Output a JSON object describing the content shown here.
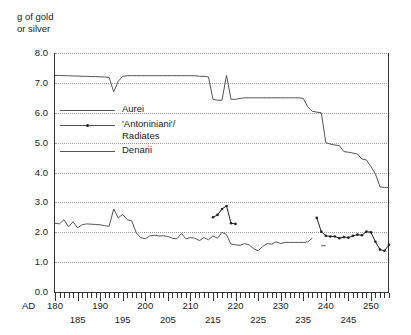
{
  "chart_data": {
    "type": "line",
    "title": "",
    "ylabel": "g of gold\nor silver",
    "xlabel": "AD",
    "ylim": [
      0.0,
      8.0
    ],
    "xlim": [
      180,
      254
    ],
    "grid": true,
    "legend_position": "inside-upper-left",
    "ytick_labels": [
      "8.0",
      "7.0",
      "6.0",
      "5.0",
      "4.0",
      "3.0",
      "2.0",
      "1.0",
      "0.0"
    ],
    "ytick_values": [
      8.0,
      7.0,
      6.0,
      5.0,
      4.0,
      3.0,
      2.0,
      1.0,
      0.0
    ],
    "xtick_labels_upper": [
      "180",
      "190",
      "200",
      "210",
      "220",
      "230",
      "240",
      "250"
    ],
    "xtick_labels_lower": [
      "185",
      "195",
      "205",
      "215",
      "225",
      "235",
      "245"
    ],
    "xtick_step": 1,
    "series": [
      {
        "name": "Aurei",
        "marker": "none",
        "color": "#555555",
        "points": [
          [
            180,
            7.25
          ],
          [
            181,
            7.25
          ],
          [
            182,
            7.24
          ],
          [
            183,
            7.24
          ],
          [
            184,
            7.23
          ],
          [
            185,
            7.23
          ],
          [
            186,
            7.22
          ],
          [
            187,
            7.22
          ],
          [
            188,
            7.21
          ],
          [
            189,
            7.21
          ],
          [
            190,
            7.2
          ],
          [
            191,
            7.2
          ],
          [
            192,
            7.18
          ],
          [
            193,
            6.7
          ],
          [
            194,
            7.05
          ],
          [
            195,
            7.22
          ],
          [
            196,
            7.24
          ],
          [
            197,
            7.24
          ],
          [
            198,
            7.24
          ],
          [
            199,
            7.24
          ],
          [
            200,
            7.24
          ],
          [
            201,
            7.24
          ],
          [
            202,
            7.24
          ],
          [
            203,
            7.24
          ],
          [
            204,
            7.24
          ],
          [
            205,
            7.24
          ],
          [
            206,
            7.24
          ],
          [
            207,
            7.24
          ],
          [
            208,
            7.24
          ],
          [
            209,
            7.24
          ],
          [
            210,
            7.24
          ],
          [
            211,
            7.24
          ],
          [
            212,
            7.22
          ],
          [
            213,
            7.22
          ],
          [
            214,
            7.2
          ],
          [
            215,
            6.45
          ],
          [
            216,
            6.42
          ],
          [
            217,
            6.42
          ],
          [
            218,
            7.25
          ],
          [
            219,
            6.45
          ],
          [
            220,
            6.45
          ],
          [
            221,
            6.48
          ],
          [
            222,
            6.5
          ],
          [
            223,
            6.5
          ],
          [
            224,
            6.5
          ],
          [
            225,
            6.5
          ],
          [
            226,
            6.5
          ],
          [
            227,
            6.5
          ],
          [
            228,
            6.5
          ],
          [
            229,
            6.5
          ],
          [
            230,
            6.5
          ],
          [
            231,
            6.5
          ],
          [
            232,
            6.5
          ],
          [
            233,
            6.5
          ],
          [
            234,
            6.5
          ],
          [
            235,
            6.48
          ],
          [
            236,
            6.2
          ],
          [
            237,
            6.05
          ],
          [
            238,
            6.02
          ],
          [
            239,
            6.0
          ],
          [
            240,
            5.0
          ],
          [
            241,
            4.95
          ],
          [
            242,
            4.92
          ],
          [
            243,
            4.9
          ],
          [
            244,
            4.7
          ],
          [
            245,
            4.68
          ],
          [
            246,
            4.65
          ],
          [
            247,
            4.62
          ],
          [
            248,
            4.45
          ],
          [
            249,
            4.42
          ],
          [
            250,
            4.2
          ],
          [
            251,
            3.95
          ],
          [
            252,
            3.52
          ],
          [
            253,
            3.5
          ],
          [
            254,
            3.5
          ]
        ]
      },
      {
        "name": "'Antoniniani'/\nRadiates",
        "marker": "dot",
        "color": "#222222",
        "segments": [
          [
            [
              215,
              2.5
            ],
            [
              216,
              2.58
            ],
            [
              217,
              2.78
            ],
            [
              218,
              2.88
            ],
            [
              219,
              2.3
            ],
            [
              220,
              2.28
            ]
          ],
          [
            [
              238,
              2.48
            ],
            [
              239,
              2.02
            ],
            [
              240,
              1.88
            ],
            [
              241,
              1.86
            ],
            [
              242,
              1.86
            ],
            [
              243,
              1.8
            ],
            [
              244,
              1.84
            ],
            [
              245,
              1.82
            ],
            [
              246,
              1.88
            ],
            [
              247,
              1.92
            ],
            [
              248,
              1.9
            ],
            [
              249,
              2.02
            ],
            [
              250,
              2.0
            ],
            [
              251,
              1.68
            ],
            [
              252,
              1.42
            ],
            [
              253,
              1.38
            ],
            [
              254,
              1.58
            ]
          ]
        ]
      },
      {
        "name": "Denarii",
        "marker": "none",
        "color": "#555555",
        "segments": [
          [
            [
              180,
              2.3
            ],
            [
              181,
              2.28
            ],
            [
              182,
              2.42
            ],
            [
              183,
              2.18
            ],
            [
              184,
              2.35
            ],
            [
              185,
              2.15
            ],
            [
              186,
              2.25
            ],
            [
              187,
              2.28
            ],
            [
              188,
              2.27
            ],
            [
              189,
              2.26
            ],
            [
              190,
              2.25
            ],
            [
              191,
              2.22
            ],
            [
              192,
              2.2
            ],
            [
              193,
              2.78
            ],
            [
              194,
              2.48
            ],
            [
              195,
              2.6
            ],
            [
              196,
              2.42
            ],
            [
              197,
              2.38
            ],
            [
              198,
              1.98
            ],
            [
              199,
              1.82
            ],
            [
              200,
              1.78
            ],
            [
              201,
              1.88
            ],
            [
              202,
              1.9
            ],
            [
              203,
              1.88
            ],
            [
              204,
              1.88
            ],
            [
              205,
              1.86
            ],
            [
              206,
              1.8
            ],
            [
              207,
              1.78
            ],
            [
              208,
              1.96
            ],
            [
              209,
              1.78
            ],
            [
              210,
              1.82
            ],
            [
              211,
              1.8
            ],
            [
              212,
              1.72
            ],
            [
              213,
              1.82
            ],
            [
              214,
              1.75
            ],
            [
              215,
              1.88
            ],
            [
              216,
              1.8
            ],
            [
              217,
              2.0
            ],
            [
              218,
              1.92
            ],
            [
              219,
              1.6
            ],
            [
              220,
              1.58
            ],
            [
              221,
              1.56
            ],
            [
              222,
              1.62
            ],
            [
              223,
              1.58
            ],
            [
              224,
              1.45
            ],
            [
              225,
              1.38
            ],
            [
              226,
              1.52
            ],
            [
              227,
              1.62
            ],
            [
              228,
              1.6
            ],
            [
              229,
              1.68
            ],
            [
              230,
              1.62
            ],
            [
              231,
              1.66
            ],
            [
              232,
              1.66
            ],
            [
              233,
              1.66
            ],
            [
              234,
              1.66
            ],
            [
              235,
              1.66
            ],
            [
              236,
              1.68
            ],
            [
              237,
              1.8
            ]
          ],
          [
            [
              239,
              1.55
            ],
            [
              240,
              1.55
            ]
          ]
        ]
      }
    ],
    "legend_entries": [
      {
        "label": "Aurei",
        "marker": "none"
      },
      {
        "label": "'Antoniniani'/\nRadiates",
        "marker": "dot"
      },
      {
        "label": "Denarii",
        "marker": "none"
      }
    ]
  }
}
